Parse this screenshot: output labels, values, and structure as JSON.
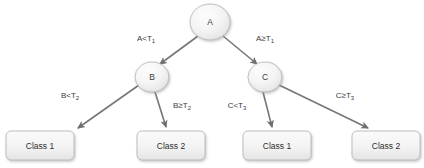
{
  "diagram": {
    "type": "decision-tree",
    "background_color": "#ffffff",
    "node_fill_color": "#f1f1f1",
    "node_border_color": "#b9b9b9",
    "edge_color": "#767676",
    "text_color": "#3a3a3a",
    "width": 424,
    "height": 168
  },
  "nodes": {
    "root": {
      "id": "A",
      "label": "A",
      "cx": 210,
      "cy": 22,
      "rx": 20,
      "ry": 18
    },
    "left": {
      "id": "B",
      "label": "B",
      "cx": 152,
      "cy": 77,
      "rx": 17,
      "ry": 15
    },
    "right": {
      "id": "C",
      "label": "C",
      "cx": 265,
      "cy": 77,
      "rx": 17,
      "ry": 15
    }
  },
  "leaves": [
    {
      "id": "leaf-1",
      "label": "Class 1",
      "x": 6,
      "y": 131,
      "w": 68,
      "h": 29
    },
    {
      "id": "leaf-2",
      "label": "Class 2",
      "x": 137,
      "y": 131,
      "w": 68,
      "h": 29
    },
    {
      "id": "leaf-3",
      "label": "Class 1",
      "x": 243,
      "y": 131,
      "w": 68,
      "h": 29
    },
    {
      "id": "leaf-4",
      "label": "Class 2",
      "x": 352,
      "y": 131,
      "w": 68,
      "h": 29
    }
  ],
  "edges": [
    {
      "id": "edge-a-left",
      "from": "A",
      "to": "B",
      "condition_main": "A<T",
      "condition_sub": "1",
      "condition_full": "A<T1",
      "label_x": 146,
      "label_y": 39
    },
    {
      "id": "edge-a-right",
      "from": "A",
      "to": "C",
      "condition_main": "A≥T",
      "condition_sub": "1",
      "condition_full": "A≥T1",
      "label_x": 265,
      "label_y": 39
    },
    {
      "id": "edge-b-left",
      "from": "B",
      "to": "Class 1",
      "condition_main": "B<T",
      "condition_sub": "2",
      "condition_full": "B<T2",
      "label_x": 70,
      "label_y": 96
    },
    {
      "id": "edge-b-right",
      "from": "B",
      "to": "Class 2",
      "condition_main": "B≥T",
      "condition_sub": "2",
      "condition_full": "B≥T2",
      "label_x": 182,
      "label_y": 106
    },
    {
      "id": "edge-c-left",
      "from": "C",
      "to": "Class 1",
      "condition_main": "C<T",
      "condition_sub": "3",
      "condition_full": "C<T3",
      "label_x": 237,
      "label_y": 106
    },
    {
      "id": "edge-c-right",
      "from": "C",
      "to": "Class 2",
      "condition_main": "C≥T",
      "condition_sub": "3",
      "condition_full": "C≥T3",
      "label_x": 345,
      "label_y": 96
    }
  ]
}
